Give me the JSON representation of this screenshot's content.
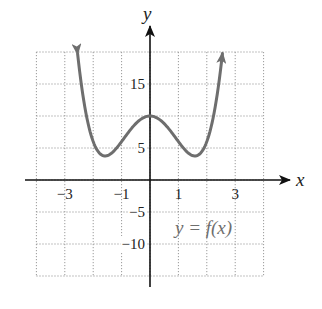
{
  "chart_data": {
    "type": "line",
    "title": "",
    "xlabel": "x",
    "ylabel": "y",
    "xlim": [
      -4,
      4
    ],
    "ylim": [
      -15,
      20
    ],
    "grid": true,
    "grid_style": "dotted",
    "x_ticks": [
      -3,
      -1,
      1,
      3
    ],
    "x_tick_labels": [
      "−3",
      "−1",
      "1",
      "3"
    ],
    "y_ticks": [
      15,
      5,
      -5,
      -10
    ],
    "y_tick_labels": [
      "15",
      "5",
      "−5",
      "−10"
    ],
    "x_gridlines": [
      -4,
      -3,
      -2,
      -1,
      0,
      1,
      2,
      3,
      4
    ],
    "y_gridlines": [
      -15,
      -10,
      -5,
      0,
      5,
      10,
      15,
      20
    ],
    "series": [
      {
        "name": "y = f(x)",
        "color": "#6e6e6e",
        "arrows_at_ends": true,
        "x": [
          -2.55,
          -2.25,
          -2.0,
          -1.75,
          -1.58,
          -1.25,
          -1.0,
          -0.5,
          0,
          0.5,
          1.0,
          1.25,
          1.58,
          1.75,
          2.0,
          2.25,
          2.55
        ],
        "y": [
          19.8,
          10.3,
          6.0,
          4.1,
          3.75,
          4.6,
          6.0,
          8.8,
          10.0,
          8.8,
          6.0,
          4.6,
          3.75,
          4.1,
          6.0,
          10.3,
          19.8
        ]
      }
    ],
    "annotations": [
      {
        "text": "y = f(x)",
        "x": 2.1,
        "y": -7.5
      }
    ]
  },
  "labels": {
    "x_axis": "x",
    "y_axis": "y",
    "function": "y = f(x)"
  }
}
